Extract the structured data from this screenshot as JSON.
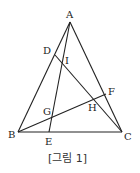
{
  "diagram": {
    "caption": "[그림 1]",
    "points": {
      "A": {
        "label": "A",
        "x": 70,
        "y": 22
      },
      "B": {
        "label": "B",
        "x": 18,
        "y": 132
      },
      "C": {
        "label": "C",
        "x": 122,
        "y": 132
      },
      "D": {
        "label": "D",
        "x": 55,
        "y": 55
      },
      "E": {
        "label": "E",
        "x": 49,
        "y": 132
      },
      "F": {
        "label": "F",
        "x": 106,
        "y": 94
      },
      "G": {
        "label": "G",
        "x": 51,
        "y": 117
      },
      "H": {
        "label": "H",
        "x": 95,
        "y": 100
      },
      "I": {
        "label": "I",
        "x": 63,
        "y": 64
      }
    },
    "segments": [
      "AB",
      "AC",
      "BC",
      "AE",
      "DC",
      "BF"
    ]
  }
}
